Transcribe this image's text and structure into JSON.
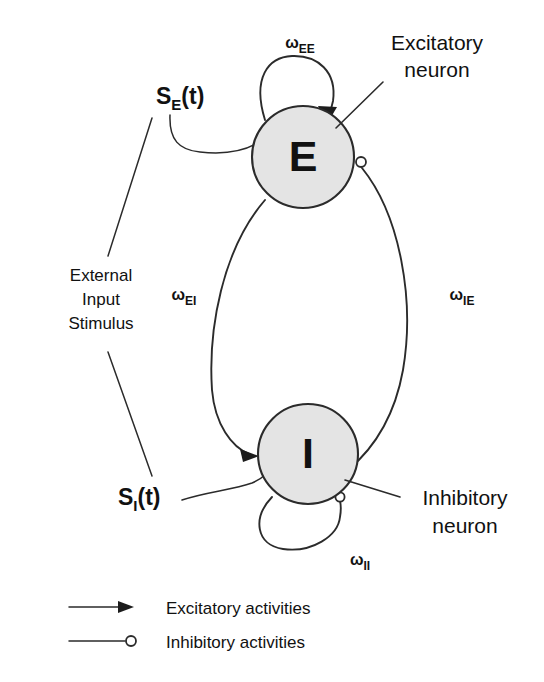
{
  "figure": {
    "background_color": "#ffffff",
    "stroke_color": "#2b2b2b",
    "neuron_fill_color": "#e4e4e4"
  },
  "nodes": {
    "excitatory": {
      "letter": "E",
      "callout_line1": "Excitatory",
      "callout_line2": "neuron"
    },
    "inhibitory": {
      "letter": "I",
      "callout_line1": "Inhibitory",
      "callout_line2": "neuron"
    }
  },
  "stimuli": {
    "excitatory_input": {
      "symbol": "S",
      "subscript": "E",
      "argument": "(t)"
    },
    "inhibitory_input": {
      "symbol": "S",
      "subscript": "I",
      "argument": "(t)"
    },
    "source_label_line1": "External",
    "source_label_line2": "Input",
    "source_label_line3": "Stimulus"
  },
  "weights": {
    "ee": {
      "symbol": "ω",
      "subscript": "EE"
    },
    "ei": {
      "symbol": "ω",
      "subscript": "EI"
    },
    "ie": {
      "symbol": "ω",
      "subscript": "IE"
    },
    "ii": {
      "symbol": "ω",
      "subscript": "II"
    }
  },
  "legend": {
    "items": [
      {
        "marker": "arrow",
        "label": "Excitatory activities"
      },
      {
        "marker": "open-circle",
        "label": "Inhibitory activities"
      }
    ]
  }
}
